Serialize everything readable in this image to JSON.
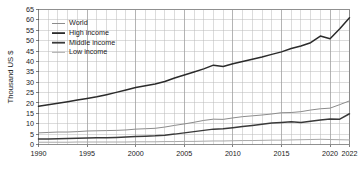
{
  "chart_data": {
    "type": "line",
    "title": "",
    "subtitle": "",
    "xlabel": "",
    "ylabel": "Thousand US $",
    "xlim": [
      1990,
      2022
    ],
    "ylim": [
      0,
      65
    ],
    "y_ticks": [
      0,
      5,
      10,
      15,
      20,
      25,
      30,
      35,
      40,
      45,
      50,
      55,
      60,
      65
    ],
    "x_ticks": [
      1990,
      1995,
      2000,
      2005,
      2010,
      2015,
      2020,
      2022
    ],
    "x_tick_labels": [
      "1990",
      "1995",
      "2000",
      "2005",
      "2010",
      "2015",
      "2020",
      "2022"
    ],
    "grid": true,
    "grid_minor_x_step": 1,
    "grid_y_step": 5,
    "legend_position": "top-left",
    "x": [
      1990,
      1991,
      1992,
      1993,
      1994,
      1995,
      1996,
      1997,
      1998,
      1999,
      2000,
      2001,
      2002,
      2003,
      2004,
      2005,
      2006,
      2007,
      2008,
      2009,
      2010,
      2011,
      2012,
      2013,
      2014,
      2015,
      2016,
      2017,
      2018,
      2019,
      2020,
      2021,
      2022
    ],
    "series": [
      {
        "name": "World",
        "color": "#8c8c8c",
        "width": 1.0,
        "values": [
          5.6,
          5.8,
          6.0,
          6.0,
          6.2,
          6.5,
          6.6,
          6.7,
          6.8,
          7.0,
          7.4,
          7.6,
          7.8,
          8.4,
          9.2,
          9.9,
          10.7,
          11.6,
          12.2,
          12.1,
          12.8,
          13.4,
          13.8,
          14.2,
          14.7,
          15.3,
          15.4,
          15.8,
          16.6,
          17.2,
          17.5,
          19.2,
          21.0
        ]
      },
      {
        "name": "High income",
        "color": "#2b2b2b",
        "width": 1.5,
        "values": [
          18.4,
          19.1,
          19.9,
          20.6,
          21.4,
          22.2,
          23.0,
          24.0,
          25.1,
          26.2,
          27.4,
          28.3,
          29.1,
          30.3,
          32.0,
          33.5,
          34.9,
          36.4,
          38.2,
          37.6,
          38.9,
          40.0,
          41.0,
          42.1,
          43.4,
          44.6,
          46.2,
          47.4,
          49.0,
          52.2,
          50.9,
          55.7,
          61.0
        ]
      },
      {
        "name": "Middle income",
        "color": "#3a3a3a",
        "width": 1.5,
        "values": [
          2.6,
          2.7,
          2.8,
          2.9,
          3.0,
          3.1,
          3.2,
          3.3,
          3.4,
          3.6,
          3.8,
          4.0,
          4.2,
          4.5,
          5.0,
          5.6,
          6.2,
          6.8,
          7.4,
          7.6,
          8.1,
          8.7,
          9.2,
          9.7,
          10.3,
          10.6,
          10.9,
          10.6,
          11.2,
          11.8,
          12.3,
          12.2,
          14.8
        ]
      },
      {
        "name": "Low income",
        "color": "#a8a8a8",
        "width": 1.0,
        "values": [
          1.1,
          1.1,
          1.1,
          1.1,
          1.2,
          1.2,
          1.2,
          1.2,
          1.2,
          1.2,
          1.3,
          1.3,
          1.3,
          1.4,
          1.4,
          1.5,
          1.5,
          1.6,
          1.7,
          1.7,
          1.8,
          1.9,
          1.9,
          2.0,
          2.1,
          2.1,
          2.2,
          2.3,
          2.4,
          2.5,
          2.4,
          2.3,
          2.2
        ]
      }
    ],
    "legend_entries": [
      {
        "label": "World",
        "color": "#8c8c8c",
        "width": 1.0
      },
      {
        "label": "High income",
        "color": "#2b2b2b",
        "width": 1.8
      },
      {
        "label": "Middle income",
        "color": "#3a3a3a",
        "width": 1.8
      },
      {
        "label": "Low income",
        "color": "#a8a8a8",
        "width": 1.0
      }
    ]
  }
}
